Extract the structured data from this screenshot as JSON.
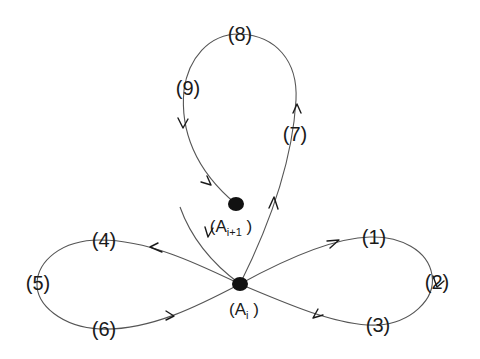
{
  "diagram": {
    "type": "state-loop-diagram",
    "nodes": {
      "a_i": {
        "label": "A",
        "subscript": "i",
        "open": "(",
        "close": ")"
      },
      "a_i1": {
        "label": "A",
        "subscript": "i+1",
        "open": "(",
        "close": ")"
      }
    },
    "points": [
      {
        "id": "1",
        "label": "(1)"
      },
      {
        "id": "2",
        "label": "(2)"
      },
      {
        "id": "3",
        "label": "(3)"
      },
      {
        "id": "4",
        "label": "(4)"
      },
      {
        "id": "5",
        "label": "(5)"
      },
      {
        "id": "6",
        "label": "(6)"
      },
      {
        "id": "7",
        "label": "(7)"
      },
      {
        "id": "8",
        "label": "(8)"
      },
      {
        "id": "9",
        "label": "(9)"
      }
    ],
    "loops": [
      {
        "name": "right-loop",
        "from": "A_i",
        "via": [
          "(1)",
          "(2)",
          "(3)"
        ],
        "to": "A_i",
        "direction": "clockwise"
      },
      {
        "name": "left-loop",
        "from": "A_i",
        "via": [
          "(4)",
          "(5)",
          "(6)"
        ],
        "to": "A_i",
        "direction": "counter-clockwise"
      },
      {
        "name": "top-loop",
        "from": "A_i",
        "via": [
          "(7)",
          "(8)",
          "(9)"
        ],
        "to": "A_i+1",
        "direction": "clockwise"
      }
    ],
    "incoming_edge": {
      "from": "upper-left",
      "to": "A_i"
    },
    "colors": {
      "line": "#555555",
      "node": "#111111",
      "text": "#1a1a1a",
      "background": "#ffffff"
    }
  }
}
